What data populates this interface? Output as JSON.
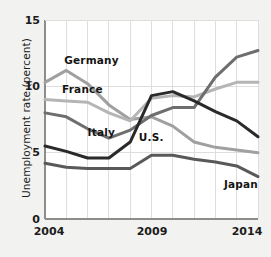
{
  "chart_data": {
    "type": "line",
    "title": "",
    "xlabel": "",
    "ylabel": "Unemployment rate (percent)",
    "xlim": [
      2004,
      2014
    ],
    "ylim": [
      0,
      15
    ],
    "yticks": [
      0,
      5,
      10,
      15
    ],
    "xticks": [
      2004,
      2009,
      2014
    ],
    "grid": "vertical-and-horizontal-faint",
    "legend_position": "inline-annotations",
    "x": [
      2004,
      2005,
      2006,
      2007,
      2008,
      2009,
      2010,
      2011,
      2012,
      2013,
      2014
    ],
    "series": [
      {
        "name": "Germany",
        "color": "#a0a0a0",
        "values": [
          10.3,
          11.2,
          10.2,
          8.6,
          7.5,
          7.7,
          7.0,
          5.8,
          5.4,
          5.2,
          5.0
        ]
      },
      {
        "name": "France",
        "color": "#b5b5b5",
        "values": [
          9.0,
          8.9,
          8.8,
          8.0,
          7.4,
          9.1,
          9.3,
          9.2,
          9.8,
          10.3,
          10.3
        ]
      },
      {
        "name": "Italy",
        "color": "#6e6e6e",
        "values": [
          8.0,
          7.7,
          6.8,
          6.1,
          6.7,
          7.8,
          8.4,
          8.4,
          10.7,
          12.2,
          12.7
        ]
      },
      {
        "name": "U.S.",
        "color": "#2a2a2a",
        "values": [
          5.5,
          5.1,
          4.6,
          4.6,
          5.8,
          9.3,
          9.6,
          8.9,
          8.1,
          7.4,
          6.2
        ]
      },
      {
        "name": "Japan",
        "color": "#595959",
        "values": [
          4.2,
          3.9,
          3.8,
          3.8,
          3.8,
          4.8,
          4.8,
          4.5,
          4.3,
          4.0,
          3.2
        ]
      }
    ],
    "annotations": [
      {
        "text": "Germany",
        "x": 2004.9,
        "y": 11.9
      },
      {
        "text": "France",
        "x": 2004.8,
        "y": 9.7
      },
      {
        "text": "Italy",
        "x": 2006.0,
        "y": 6.5
      },
      {
        "text": "U.S.",
        "x": 2008.4,
        "y": 6.1
      },
      {
        "text": "Japan",
        "x": 2012.4,
        "y": 2.6
      }
    ]
  },
  "axes": {
    "ylabel": "Unemployment rate (percent)",
    "ytick_labels": [
      "15",
      "10",
      "5",
      "0"
    ],
    "xtick_labels": [
      "2004",
      "2009",
      "2014"
    ]
  },
  "colors": {
    "background": "#f2f2f0",
    "plot_background": "#ffffff",
    "gridline": "#dedede",
    "axis": "#8c8c8c",
    "text": "#1b1b1b"
  }
}
